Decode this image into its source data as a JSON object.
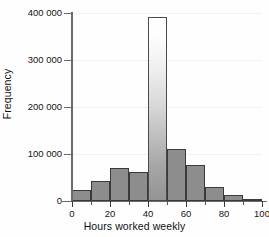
{
  "chart_data": {
    "type": "bar",
    "title": "",
    "subtitle": "",
    "xlabel": "Hours worked weekly",
    "ylabel": "Frequency",
    "xlim": [
      0,
      100
    ],
    "ylim": [
      0,
      400000
    ],
    "grid": true,
    "legend": null,
    "bin_width": 10,
    "x_ticks": [
      0,
      20,
      40,
      60,
      80,
      100
    ],
    "x_tick_labels": [
      "0",
      "20",
      "40",
      "60",
      "80",
      "100"
    ],
    "x_minor_ticks": [
      10,
      30,
      50,
      70,
      90
    ],
    "y_ticks": [
      0,
      100000,
      200000,
      300000,
      400000
    ],
    "y_tick_labels": [
      "0",
      "100 000",
      "200 000",
      "300 000",
      "400 000"
    ],
    "categories": [
      "0-10",
      "10-20",
      "20-30",
      "30-40",
      "40-50",
      "50-60",
      "60-70",
      "70-80",
      "80-90",
      "90-100"
    ],
    "bin_edges": [
      0,
      10,
      20,
      30,
      40,
      50,
      60,
      70,
      80,
      90,
      100
    ],
    "values": [
      23000,
      42000,
      70000,
      62000,
      392000,
      110000,
      77000,
      29000,
      12000,
      5000
    ],
    "bars": [
      {
        "label": "0-10",
        "x0": 0,
        "x1": 10,
        "value": 23000,
        "style": "solid"
      },
      {
        "label": "10-20",
        "x0": 10,
        "x1": 20,
        "value": 42000,
        "style": "solid"
      },
      {
        "label": "20-30",
        "x0": 20,
        "x1": 30,
        "value": 70000,
        "style": "solid"
      },
      {
        "label": "30-40",
        "x0": 30,
        "x1": 40,
        "value": 62000,
        "style": "solid"
      },
      {
        "label": "40-50",
        "x0": 40,
        "x1": 50,
        "value": 392000,
        "style": "gradient"
      },
      {
        "label": "50-60",
        "x0": 50,
        "x1": 60,
        "value": 110000,
        "style": "solid"
      },
      {
        "label": "60-70",
        "x0": 60,
        "x1": 70,
        "value": 77000,
        "style": "solid"
      },
      {
        "label": "70-80",
        "x0": 70,
        "x1": 80,
        "value": 29000,
        "style": "solid"
      },
      {
        "label": "80-90",
        "x0": 80,
        "x1": 90,
        "value": 12000,
        "style": "solid"
      },
      {
        "label": "90-100",
        "x0": 90,
        "x1": 100,
        "value": 5000,
        "style": "solid"
      }
    ],
    "colors": {
      "bar_fill": "#8d8d8d",
      "bar_edge": "#3a3a3a",
      "tall_bar_top": "#ffffff",
      "tall_bar_bottom": "#949494",
      "axis": "#6a6a6a",
      "gridline": "#f1f1f1",
      "text": "#141414",
      "background": "#ffffff"
    }
  }
}
